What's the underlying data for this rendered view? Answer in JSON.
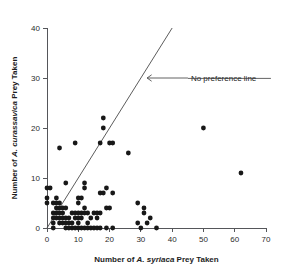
{
  "chart_data": {
    "type": "scatter",
    "title": "",
    "xlabel_prefix": "Number of ",
    "xlabel_species": "A. syriaca",
    "xlabel_suffix": " Prey Taken",
    "xlabel": "Number of A. syriaca Prey Taken",
    "ylabel_prefix": "Number of ",
    "ylabel_species": "A. curassavica",
    "ylabel_suffix": " Prey Taken",
    "ylabel": "Number of A. curassavica Prey Taken",
    "xlim": [
      0,
      70
    ],
    "ylim": [
      0,
      40
    ],
    "xticks": [
      0,
      10,
      20,
      30,
      40,
      50,
      60,
      70
    ],
    "yticks": [
      0,
      10,
      20,
      30,
      40
    ],
    "xtick_labels": [
      "0",
      "10",
      "20",
      "30",
      "40",
      "50",
      "60",
      "70"
    ],
    "ytick_labels": [
      "0",
      "10",
      "20",
      "30",
      "40"
    ],
    "grid": false,
    "legend": null,
    "marker_color": "#181818",
    "marker_size": 2.4,
    "annotations": [
      {
        "text": "No preference line",
        "x": 46,
        "y": 30,
        "arrow_to_x": 32,
        "arrow_to_y": 30
      }
    ],
    "reference_line": {
      "name": "No preference line",
      "slope": 1,
      "intercept": 0,
      "x_start": 0,
      "y_start": 0,
      "x_end": 40,
      "y_end": 40,
      "color": "#4a4a4a"
    },
    "points": [
      [
        0,
        8
      ],
      [
        0,
        6
      ],
      [
        0,
        5
      ],
      [
        1,
        8
      ],
      [
        2,
        5
      ],
      [
        2,
        3
      ],
      [
        2,
        2
      ],
      [
        2,
        1
      ],
      [
        2,
        0
      ],
      [
        3,
        6
      ],
      [
        3,
        5
      ],
      [
        3,
        4
      ],
      [
        3,
        3
      ],
      [
        3,
        2
      ],
      [
        4,
        16
      ],
      [
        4,
        5
      ],
      [
        4,
        4
      ],
      [
        4,
        3
      ],
      [
        4,
        2
      ],
      [
        4,
        1
      ],
      [
        5,
        4
      ],
      [
        5,
        3
      ],
      [
        5,
        2
      ],
      [
        5,
        1
      ],
      [
        6,
        9
      ],
      [
        6,
        4
      ],
      [
        6,
        2
      ],
      [
        6,
        1
      ],
      [
        6,
        0
      ],
      [
        7,
        2
      ],
      [
        7,
        1
      ],
      [
        7,
        0
      ],
      [
        8,
        3
      ],
      [
        8,
        1
      ],
      [
        8,
        0
      ],
      [
        9,
        17
      ],
      [
        9,
        3
      ],
      [
        9,
        2
      ],
      [
        9,
        0
      ],
      [
        10,
        6
      ],
      [
        10,
        5
      ],
      [
        10,
        3
      ],
      [
        10,
        2
      ],
      [
        10,
        1
      ],
      [
        10,
        0
      ],
      [
        11,
        6
      ],
      [
        11,
        3
      ],
      [
        11,
        2
      ],
      [
        11,
        0
      ],
      [
        12,
        9
      ],
      [
        12,
        8
      ],
      [
        12,
        4
      ],
      [
        12,
        3
      ],
      [
        12,
        0
      ],
      [
        13,
        3
      ],
      [
        13,
        1
      ],
      [
        13,
        0
      ],
      [
        14,
        2
      ],
      [
        14,
        0
      ],
      [
        15,
        3
      ],
      [
        15,
        0
      ],
      [
        16,
        3
      ],
      [
        16,
        2
      ],
      [
        16,
        0
      ],
      [
        17,
        17
      ],
      [
        17,
        7
      ],
      [
        17,
        3
      ],
      [
        17,
        0
      ],
      [
        18,
        22
      ],
      [
        18,
        20
      ],
      [
        18,
        7
      ],
      [
        19,
        8
      ],
      [
        19,
        4
      ],
      [
        19,
        0
      ],
      [
        20,
        17
      ],
      [
        20,
        4
      ],
      [
        21,
        17
      ],
      [
        21,
        7
      ],
      [
        21,
        0
      ],
      [
        26,
        15
      ],
      [
        29,
        5
      ],
      [
        29,
        1
      ],
      [
        30,
        0
      ],
      [
        31,
        4
      ],
      [
        31,
        3
      ],
      [
        32,
        1
      ],
      [
        33,
        2
      ],
      [
        35,
        0
      ],
      [
        50,
        20
      ],
      [
        62,
        11
      ]
    ]
  }
}
